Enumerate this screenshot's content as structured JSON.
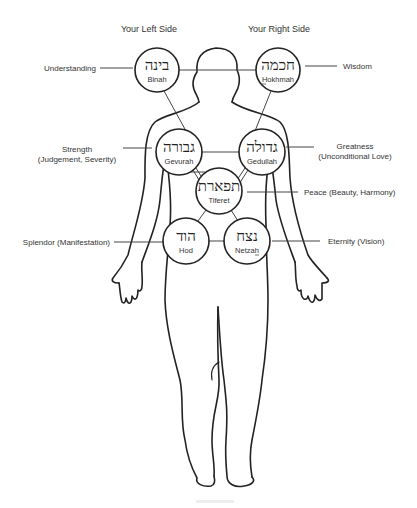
{
  "headers": {
    "left_side": "Your Left Side",
    "right_side": "Your Right Side"
  },
  "sefirot": [
    {
      "id": "binah",
      "hebrew": "בינה",
      "name": "Binah",
      "meaning": "Understanding"
    },
    {
      "id": "hokhmah",
      "hebrew": "חכמה",
      "name": "Hokhmah",
      "meaning": "Wisdom"
    },
    {
      "id": "gevurah",
      "hebrew": "גבורה",
      "name": "Gevurah",
      "meaning_line1": "Strength",
      "meaning_line2": "(Judgement, Severity)"
    },
    {
      "id": "gedullah",
      "hebrew": "גדולה",
      "name": "Gedullah",
      "meaning_line1": "Greatness",
      "meaning_line2": "(Unconditional Love)"
    },
    {
      "id": "tiferet",
      "hebrew": "תפארת",
      "name": "Tiferet",
      "meaning": "Peace (Beauty, Harmony)"
    },
    {
      "id": "hod",
      "hebrew": "הוד",
      "name": "Hod",
      "meaning": "Splendor (Manifestation)"
    },
    {
      "id": "netzah",
      "hebrew": "נצח",
      "name": "Netzah",
      "meaning": "Eternity (Vision)"
    }
  ],
  "colors": {
    "line": "#222222",
    "text": "#333333",
    "background": "#ffffff"
  }
}
